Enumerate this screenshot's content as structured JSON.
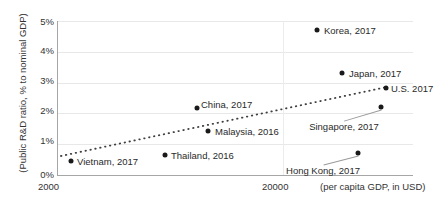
{
  "chart_data": {
    "type": "scatter",
    "title": "",
    "xlabel": "(per capita GDP, in USD)",
    "ylabel": "(Public R&D ratio, % to nominal GDP)",
    "x_scale": "log",
    "xlim": [
      2000,
      80000
    ],
    "ylim": [
      0,
      5
    ],
    "x_ticklabels": [
      "2000",
      "20000"
    ],
    "x_tickvalues": [
      2000,
      20000
    ],
    "y_ticklabels": [
      "0%",
      "1%",
      "2%",
      "3%",
      "4%",
      "5%"
    ],
    "y_tickvalues": [
      0,
      1,
      2,
      3,
      4,
      5
    ],
    "grid": "horizontal",
    "legend": "none",
    "points": [
      {
        "label": "Vietnam, 2017",
        "gdp_per_capita": 2400,
        "rd_ratio_pct": 0.55,
        "px": 70,
        "py": 161,
        "label_x": 76,
        "label_y": 161,
        "label_pos": "left"
      },
      {
        "label": "Thailand, 2016",
        "gdp_per_capita": 6600,
        "rd_ratio_pct": 0.85,
        "px": 164,
        "py": 155,
        "label_x": 170,
        "label_y": 155,
        "label_pos": "left"
      },
      {
        "label": "China, 2017",
        "gdp_per_capita": 8800,
        "rd_ratio_pct": 2.15,
        "px": 196,
        "py": 108,
        "label_x": 200,
        "label_y": 104,
        "label_pos": "left"
      },
      {
        "label": "Malaysia, 2016",
        "gdp_per_capita": 9800,
        "rd_ratio_pct": 1.45,
        "px": 207,
        "py": 131,
        "label_x": 214,
        "label_y": 131,
        "label_pos": "left"
      },
      {
        "label": "Korea, 2017",
        "gdp_per_capita": 29700,
        "rd_ratio_pct": 4.55,
        "px": 316,
        "py": 30,
        "label_x": 323,
        "label_y": 30,
        "label_pos": "left"
      },
      {
        "label": "Japan, 2017",
        "gdp_per_capita": 38400,
        "rd_ratio_pct": 3.2,
        "px": 341,
        "py": 73,
        "label_x": 348,
        "label_y": 73,
        "label_pos": "left"
      },
      {
        "label": "U.S. 2017",
        "gdp_per_capita": 59500,
        "rd_ratio_pct": 2.8,
        "px": 385,
        "py": 88,
        "label_x": 390,
        "label_y": 88,
        "label_pos": "left"
      },
      {
        "label": "Singapore, 2017",
        "gdp_per_capita": 57700,
        "rd_ratio_pct": 2.2,
        "px": 380,
        "py": 107,
        "label_x": 343,
        "label_y": 121,
        "label_pos": "below"
      },
      {
        "label": "Hong Kong, 2017",
        "gdp_per_capita": 46200,
        "rd_ratio_pct": 0.85,
        "px": 357,
        "py": 153,
        "label_x": 322,
        "label_y": 165,
        "label_pos": "below"
      }
    ],
    "trendline": {
      "style": "dotted",
      "color": "#3f3f3f",
      "x1": 60,
      "y1": 156,
      "x2": 386,
      "y2": 87
    }
  },
  "axes": {
    "y_title": "(Public R&D ratio, % to nominal GDP)",
    "x_title": "(per capita GDP, in USD)",
    "y_ticks": [
      {
        "text": "5%",
        "y": 17
      },
      {
        "text": "4%",
        "y": 46
      },
      {
        "text": "3%",
        "y": 76
      },
      {
        "text": "2%",
        "y": 106
      },
      {
        "text": "1%",
        "y": 136
      },
      {
        "text": "0%",
        "y": 170
      }
    ],
    "x_ticks": [
      {
        "text": "2000",
        "x": 38
      },
      {
        "text": "20000",
        "x": 262
      }
    ]
  },
  "colors": {
    "point": "#1a1a1a",
    "trend": "#3f3f3f",
    "axis": "#a6a6a6",
    "grid": "#e8e8e8",
    "text": "#2a2a2a",
    "background": "#ffffff"
  }
}
